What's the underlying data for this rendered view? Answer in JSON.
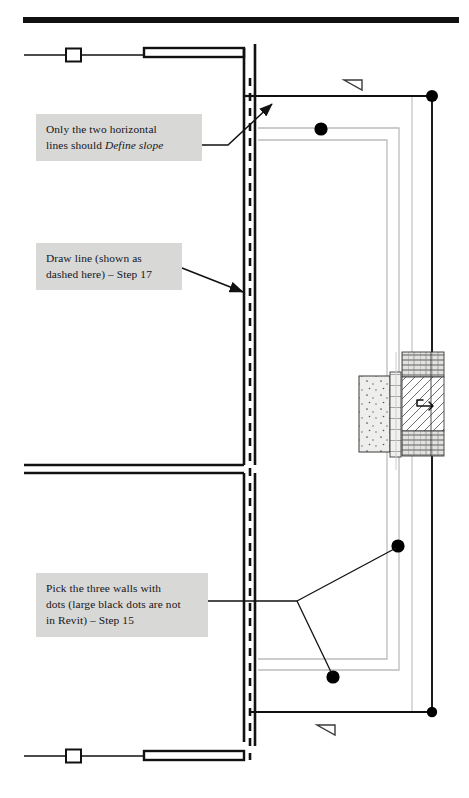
{
  "page": {
    "width": 469,
    "height": 798,
    "background_color": "#ffffff"
  },
  "rule": {
    "name": "top-header-rule",
    "color": "#111111"
  },
  "callouts": [
    {
      "id": "define-slope",
      "text_line1": "Only the two horizontal",
      "text_line2_plain": "lines should ",
      "text_line2_italic": "Define slope",
      "fill_color": "#d8d8d6",
      "border_color": "#3a3a38"
    },
    {
      "id": "draw-line",
      "text_line1": "Draw line (shown as",
      "text_line2": "dashed here) – Step 17",
      "fill_color": "#d8d8d6",
      "border_color": "#3a3a38"
    },
    {
      "id": "pick-walls",
      "text_line1": "Pick the three walls with",
      "text_line2": "dots (large black dots are not",
      "text_line3": "in Revit) – Step 15",
      "fill_color": "#d8d8d6",
      "border_color": "#3a3a38"
    }
  ],
  "drawing": {
    "wall_color": "#111111",
    "model_line_color": "#b4b4b4",
    "dashed_line_color": "#111111",
    "dot_color": "#000000",
    "slope_arrow_color": "#333333",
    "hatch_color": "#4a4a4a",
    "concrete_fill": "#e8e8e6",
    "brick_fill": "#dedede",
    "dots": [
      {
        "name": "dot-top-right-corner",
        "cx": 432,
        "cy": 96,
        "r": 6
      },
      {
        "name": "dot-top-wall",
        "cx": 321,
        "cy": 129,
        "r": 6.5
      },
      {
        "name": "dot-bottom-wall",
        "cx": 333,
        "cy": 677,
        "r": 6.5
      },
      {
        "name": "dot-right-wall",
        "cx": 398,
        "cy": 546,
        "r": 6.5
      },
      {
        "name": "dot-bottom-right-corner",
        "cx": 432,
        "cy": 712,
        "r": 5
      }
    ],
    "slope_symbols": [
      {
        "name": "slope-triangle-top",
        "x": 345,
        "y": 78
      },
      {
        "name": "slope-triangle-bottom",
        "x": 318,
        "y": 723
      }
    ]
  }
}
